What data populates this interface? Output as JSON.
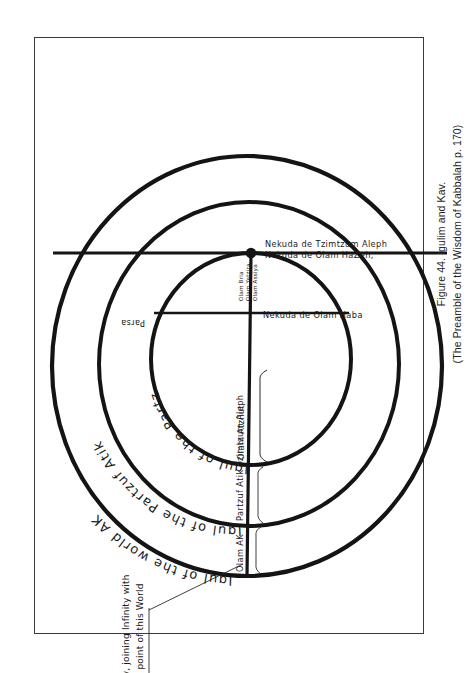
{
  "figure": {
    "caption_line1": "Figure 44. Igulim and Kav.",
    "caption_line2": "(The Preamble of the Wisdom of Kabbalah p. 170)"
  },
  "annotations": {
    "kav_note_line1": "Kav, joining Infinity with",
    "kav_note_line2": "the point of this World"
  },
  "circles": {
    "outer_label": "Igul of the world  AK",
    "middle_label": "Igul of the Partzuf Atik",
    "inner_label": "Igul of the Partzuf Arich Anpin",
    "ring_outer_name": "Olam AK",
    "ring_middle_name": "Partzuf Atik Tzimtzum Aleph",
    "ring_inner_name": "Olam Atzilut"
  },
  "inner_labels": {
    "parsa": "Parsa",
    "bya_1": "Olam Bria",
    "bya_2": "Olam Yetzira",
    "bya_3": "Olam Assiya",
    "nekuda_haba": "Nekuda de Olam Haba",
    "nekuda_hazeh_line1": "Nekuda de Olam HaZeh,",
    "nekuda_hazeh_line2": "Nekuda de Tzimtzum Aleph"
  },
  "colors": {
    "ink": "#141414",
    "frame": "#3a3a3a",
    "caption": "#232323",
    "page": "#ffffff"
  }
}
